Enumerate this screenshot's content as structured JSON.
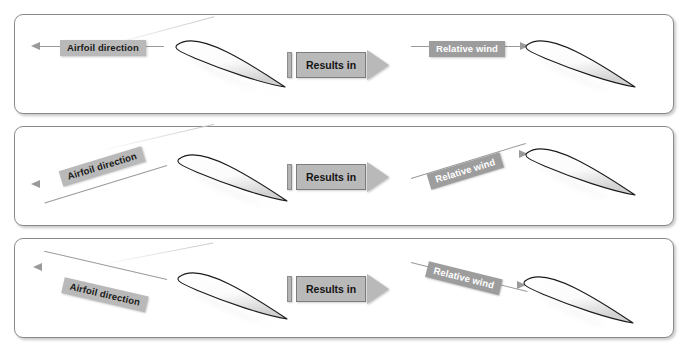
{
  "figure": {
    "background_color": "#ffffff",
    "panel_border_color": "#8a8a8a",
    "airfoil_outline_color": "#1b1b1b",
    "label_airfoil_bg": "#b9b9b9",
    "label_airfoil_text_color": "#1a1a1a",
    "label_wind_bg": "#9d9d9d",
    "label_wind_text_color": "#ffffff",
    "arrow_color": "#9a9a9a"
  },
  "panels": [
    {
      "id": "panel-level-flight",
      "left_label": "Airfoil direction",
      "left_label_angle_deg": 0,
      "connector_label": "Results in",
      "right_label": "Relative wind",
      "right_label_angle_deg": 0,
      "airfoil_angle_deg": 18
    },
    {
      "id": "panel-descent",
      "left_label": "Airfoil direction",
      "left_label_angle_deg": 18,
      "connector_label": "Results in",
      "right_label": "Relative wind",
      "right_label_angle_deg": -18,
      "airfoil_angle_deg": 18
    },
    {
      "id": "panel-climb",
      "left_label": "Airfoil direction",
      "left_label_angle_deg": -14,
      "connector_label": "Results in",
      "right_label": "Relative wind",
      "right_label_angle_deg": 14,
      "airfoil_angle_deg": 18
    }
  ]
}
